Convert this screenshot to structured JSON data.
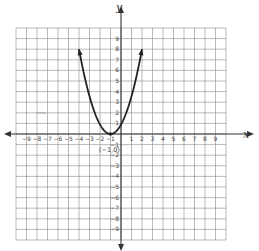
{
  "chart_data": {
    "type": "line",
    "title": "",
    "xlabel": "x",
    "ylabel": "y",
    "xlim": [
      -10,
      10
    ],
    "ylim": [
      -10,
      10
    ],
    "grid": true,
    "x_ticks": [
      -9,
      -8,
      -7,
      -6,
      -5,
      -4,
      -3,
      -2,
      -1,
      1,
      2,
      3,
      4,
      5,
      6,
      7,
      8,
      9
    ],
    "y_ticks": [
      -9,
      -8,
      -7,
      -6,
      -5,
      -4,
      -3,
      -2,
      -1,
      1,
      2,
      3,
      4,
      5,
      6,
      7,
      8,
      9
    ],
    "series": [
      {
        "name": "parabola",
        "equation": "y = (8/9)(x + 1)^2",
        "vertex": [
          -1,
          0
        ],
        "x": [
          -4,
          -3.5,
          -3,
          -2.5,
          -2,
          -1.5,
          -1,
          -0.5,
          0,
          0.5,
          1,
          1.5,
          2
        ],
        "y": [
          8,
          5.56,
          3.56,
          2,
          0.89,
          0.22,
          0,
          0.22,
          0.89,
          2,
          3.56,
          5.56,
          8
        ],
        "arrows_at_ends": true,
        "color": "#222222"
      }
    ],
    "annotations": [
      {
        "text": "(-1, 0)",
        "x": -1,
        "y": 0,
        "position": "below"
      }
    ]
  },
  "labels": {
    "x_axis": "x",
    "y_axis": "y",
    "vertex": "(−1,0)"
  }
}
